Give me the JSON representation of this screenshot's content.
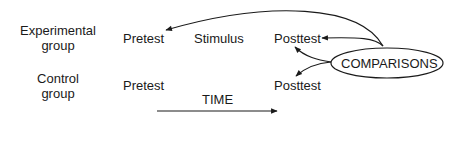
{
  "groups": {
    "experimental": {
      "line1": "Experimental",
      "line2": "group"
    },
    "control": {
      "line1": "Control",
      "line2": "group"
    }
  },
  "experimental_row": {
    "pretest": "Pretest",
    "stimulus": "Stimulus",
    "posttest": "Posttest"
  },
  "control_row": {
    "pretest": "Pretest",
    "posttest": "Posttest"
  },
  "comparisons": {
    "label": "COMPARISONS"
  },
  "time_axis": {
    "label": "TIME"
  },
  "colors": {
    "ink": "#1a1a1a",
    "background": "#ffffff"
  }
}
